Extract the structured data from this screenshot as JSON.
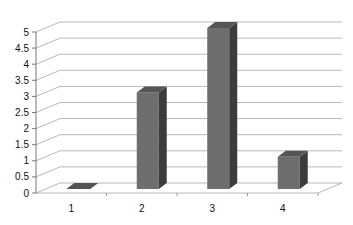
{
  "chart_data": {
    "type": "bar",
    "style": "3d-column",
    "title": "",
    "xlabel": "",
    "ylabel": "",
    "categories": [
      "1",
      "2",
      "3",
      "4"
    ],
    "values": [
      0,
      3,
      5,
      1
    ],
    "ylim": [
      0,
      5
    ],
    "yticks": [
      "0",
      "0.5",
      "1",
      "1.5",
      "2",
      "2.5",
      "3",
      "3.5",
      "4",
      "4.5",
      "5"
    ],
    "grid": true,
    "legend": null,
    "colors": {
      "front": "#6e6e6e",
      "side": "#3c3c3c",
      "top": "#555555",
      "grid": "#b8b8b8"
    }
  }
}
